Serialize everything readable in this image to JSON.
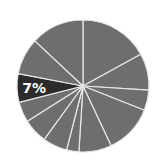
{
  "chart_data": {
    "type": "pie",
    "title": "",
    "start_angle_deg": 0,
    "direction": "clockwise",
    "center": [
      83,
      86
    ],
    "radius": 66,
    "colors": {
      "default": "#6e6e6e",
      "highlight": "#2b2b2b",
      "separator": "#e8e8e8",
      "label": "#ffffff"
    },
    "slices": [
      {
        "value": 17,
        "label": "",
        "highlight": false
      },
      {
        "value": 9,
        "label": "",
        "highlight": false
      },
      {
        "value": 5,
        "label": "",
        "highlight": false
      },
      {
        "value": 12,
        "label": "",
        "highlight": false
      },
      {
        "value": 8,
        "label": "",
        "highlight": false
      },
      {
        "value": 3,
        "label": "",
        "highlight": false
      },
      {
        "value": 6,
        "label": "",
        "highlight": false
      },
      {
        "value": 6,
        "label": "",
        "highlight": false
      },
      {
        "value": 5,
        "label": "",
        "highlight": false
      },
      {
        "value": 7,
        "label": "7%",
        "highlight": true
      },
      {
        "value": 9,
        "label": "",
        "highlight": false
      },
      {
        "value": 13,
        "label": "",
        "highlight": false
      }
    ],
    "annotations": [
      "7%"
    ]
  }
}
